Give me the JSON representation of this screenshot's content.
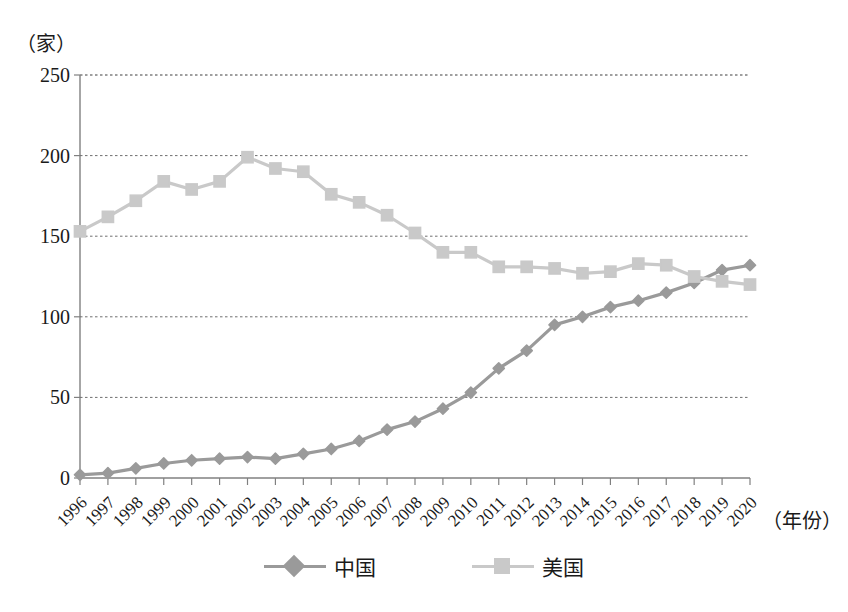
{
  "chart_data": {
    "type": "line",
    "title": "",
    "xlabel": "（年份）",
    "ylabel": "（家）",
    "ylim": [
      0,
      250
    ],
    "yticks": [
      0,
      50,
      100,
      150,
      200,
      250
    ],
    "grid": true,
    "legend_position": "bottom",
    "categories": [
      "1996",
      "1997",
      "1998",
      "1999",
      "2000",
      "2001",
      "2002",
      "2003",
      "2004",
      "2005",
      "2006",
      "2007",
      "2008",
      "2009",
      "2010",
      "2011",
      "2012",
      "2013",
      "2014",
      "2015",
      "2016",
      "2017",
      "2018",
      "2019",
      "2020"
    ],
    "series": [
      {
        "name": "中国",
        "color": "#9a9a9a",
        "marker": "diamond",
        "values": [
          2,
          3,
          6,
          9,
          11,
          12,
          13,
          12,
          15,
          18,
          23,
          30,
          35,
          43,
          53,
          68,
          79,
          95,
          100,
          106,
          110,
          115,
          121,
          129,
          132
        ]
      },
      {
        "name": "美国",
        "color": "#c9c9c9",
        "marker": "square",
        "values": [
          153,
          162,
          172,
          184,
          179,
          184,
          199,
          192,
          190,
          176,
          171,
          163,
          152,
          140,
          140,
          131,
          131,
          130,
          127,
          128,
          133,
          132,
          125,
          122,
          120
        ]
      }
    ]
  },
  "legend": {
    "entries": [
      {
        "label": "中国"
      },
      {
        "label": "美国"
      }
    ]
  },
  "axes": {
    "y_unit": "（家）",
    "x_unit": "（年份）"
  }
}
